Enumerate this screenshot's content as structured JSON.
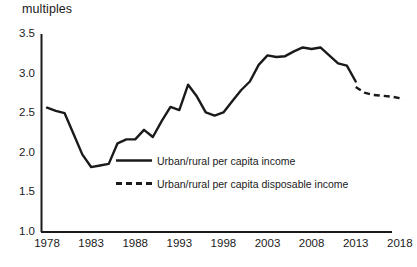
{
  "chart_data": {
    "type": "line",
    "title": "",
    "subtitle": "",
    "xlabel": "",
    "ylabel": "multiples",
    "ylim": [
      1.0,
      3.5
    ],
    "xlim": [
      1978,
      2021
    ],
    "grid": false,
    "legend_position": "center",
    "ytick_labels": [
      "3.5",
      "3.0",
      "2.5",
      "2.0",
      "1.5",
      "1.0"
    ],
    "ytick_values": [
      3.5,
      3.0,
      2.5,
      2.0,
      1.5,
      1.0
    ],
    "xtick_labels": [
      "1978",
      "1983",
      "1988",
      "1993",
      "1998",
      "2003",
      "2008",
      "2013",
      "2018"
    ],
    "xtick_values": [
      1978,
      1983,
      1988,
      1993,
      1998,
      2003,
      2008,
      2013,
      2018
    ],
    "series": [
      {
        "name": "Urban/rural per capita income",
        "style": "solid",
        "color": "#1a1a1a",
        "x": [
          1978,
          1979,
          1980,
          1981,
          1982,
          1983,
          1984,
          1985,
          1986,
          1987,
          1988,
          1989,
          1990,
          1991,
          1992,
          1993,
          1994,
          1995,
          1996,
          1997,
          1998,
          1999,
          2000,
          2001,
          2002,
          2003,
          2004,
          2005,
          2006,
          2007,
          2008,
          2009,
          2010,
          2011,
          2012,
          2013
        ],
        "values": [
          2.57,
          2.53,
          2.5,
          2.24,
          1.98,
          1.82,
          1.84,
          1.86,
          2.12,
          2.17,
          2.17,
          2.29,
          2.2,
          2.4,
          2.58,
          2.54,
          2.86,
          2.71,
          2.51,
          2.47,
          2.51,
          2.65,
          2.79,
          2.9,
          3.11,
          3.23,
          3.21,
          3.22,
          3.28,
          3.33,
          3.31,
          3.33,
          3.23,
          3.13,
          3.1,
          2.9
        ]
      },
      {
        "name": "Urban/rural per capita disposable income",
        "style": "dashed",
        "color": "#1a1a1a",
        "x": [
          2013,
          2014,
          2015,
          2016,
          2017,
          2018,
          2019,
          2020
        ],
        "values": [
          2.83,
          2.76,
          2.73,
          2.72,
          2.71,
          2.69,
          2.64,
          2.47
        ]
      }
    ]
  },
  "legend": {
    "items": [
      {
        "label": "Urban/rural per capita income",
        "style": "solid"
      },
      {
        "label": "Urban/rural per capita disposable income",
        "style": "dashed"
      }
    ]
  }
}
